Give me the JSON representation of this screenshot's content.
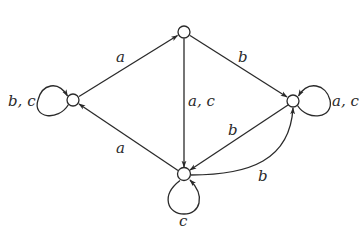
{
  "diagram": {
    "type": "automaton",
    "colors": {
      "stroke": "#2a2a2a",
      "background": "#ffffff"
    },
    "nodes": [
      {
        "id": "left",
        "x": 73,
        "y": 100
      },
      {
        "id": "top",
        "x": 184,
        "y": 32
      },
      {
        "id": "right",
        "x": 293,
        "y": 101
      },
      {
        "id": "bottom",
        "x": 184,
        "y": 174
      }
    ],
    "edges": [
      {
        "from": "left",
        "to": "top",
        "label": "a"
      },
      {
        "from": "top",
        "to": "right",
        "label": "b"
      },
      {
        "from": "top",
        "to": "bottom",
        "label": "a, c"
      },
      {
        "from": "bottom",
        "to": "left",
        "label": "a"
      },
      {
        "from": "right",
        "to": "bottom",
        "label": "b"
      },
      {
        "from": "bottom",
        "to": "right",
        "label": "b",
        "curved": true
      },
      {
        "from": "left",
        "to": "left",
        "label": "b, c",
        "self_loop": true
      },
      {
        "from": "right",
        "to": "right",
        "label": "a, c",
        "self_loop": true
      },
      {
        "from": "bottom",
        "to": "bottom",
        "label": "c",
        "self_loop": true
      }
    ]
  }
}
